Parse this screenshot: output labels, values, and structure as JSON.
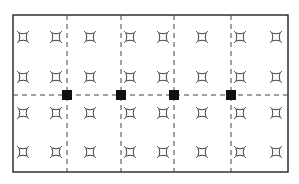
{
  "diagram": {
    "frame": {
      "x": 13,
      "y": 15,
      "width": 275,
      "height": 157
    },
    "colors": {
      "line": "#222222",
      "dash": "#444444",
      "fill": "#111111",
      "background": "#ffffff"
    },
    "vertical_dividers_x": [
      67,
      121,
      174,
      231
    ],
    "horizontal_divider_y": 95,
    "symbol_type": "luminaire-icon",
    "symbol_columns_x": [
      23,
      56,
      90,
      130,
      163,
      202,
      240,
      276
    ],
    "symbol_rows_y": [
      37,
      77,
      113,
      152
    ],
    "junction_boxes": [
      {
        "x": 67,
        "y": 95
      },
      {
        "x": 121,
        "y": 95
      },
      {
        "x": 174,
        "y": 95
      },
      {
        "x": 231,
        "y": 95
      }
    ],
    "junction_size": 10
  }
}
